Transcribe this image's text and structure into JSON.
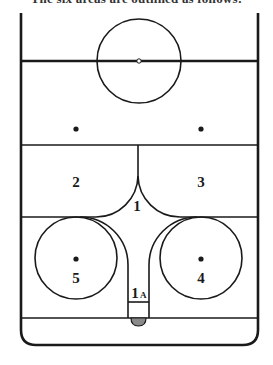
{
  "caption": "The six areas are outlined as follows:",
  "diagram": {
    "zones": [
      {
        "id": "1",
        "label": "1"
      },
      {
        "id": "1A",
        "label": "1",
        "sub": "A"
      },
      {
        "id": "2",
        "label": "2"
      },
      {
        "id": "3",
        "label": "3"
      },
      {
        "id": "4",
        "label": "4"
      },
      {
        "id": "5",
        "label": "5"
      }
    ],
    "colors": {
      "line": "#1a1a1a",
      "background": "#ffffff",
      "net": "#888888"
    }
  }
}
